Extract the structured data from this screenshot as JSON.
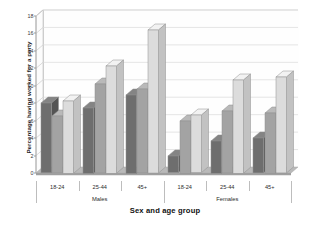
{
  "chart_data": {
    "type": "bar",
    "title": "",
    "xlabel": "Sex and age group",
    "ylabel": "Percentage having worked for a party",
    "ylim": [
      0,
      18
    ],
    "yticks": [
      0,
      2,
      4,
      6,
      8,
      10,
      12,
      14,
      16,
      18
    ],
    "ytick_labels": [
      "0",
      "2",
      "4",
      "6",
      "8",
      "10",
      "12",
      "14",
      "16",
      "18"
    ],
    "grid": true,
    "legend_position": "none",
    "style": "3d-clustered-column-grayscale",
    "categories": [
      "18-24",
      "25-44",
      "45+",
      "18-24",
      "25-44",
      "45+"
    ],
    "super_categories": [
      {
        "label": "Males",
        "spans": [
          "18-24",
          "25-44",
          "45+"
        ]
      },
      {
        "label": "Females",
        "spans": [
          "18-24",
          "25-44",
          "45+"
        ]
      }
    ],
    "series": [
      {
        "name": "series-1",
        "color": "#6e6e6e",
        "values": [
          8.0,
          7.5,
          9.0,
          1.9,
          3.7,
          4.0
        ]
      },
      {
        "name": "series-2",
        "color": "#a3a3a3",
        "values": [
          6.5,
          10.2,
          9.6,
          6.0,
          7.1,
          6.9
        ]
      },
      {
        "name": "series-3",
        "color": "#dcdcdc",
        "values": [
          8.3,
          12.3,
          16.4,
          6.6,
          10.7,
          11.0
        ]
      }
    ]
  },
  "axes": {
    "y_title": "Percentage having worked for a party",
    "x_title": "Sex and age group"
  },
  "colors": {
    "series_1": "#6e6e6e",
    "series_2": "#a3a3a3",
    "series_3": "#dcdcdc",
    "grid": "#d6d6d6",
    "floor": "#b5b5b5",
    "background": "#ffffff",
    "text": "#1d1d1d"
  }
}
